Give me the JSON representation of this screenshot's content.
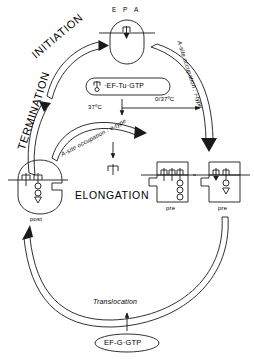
{
  "diagram": {
    "stroke_color": "#1a1a1a",
    "background_color": "#ffffff"
  },
  "labels": {
    "site_e": "E",
    "site_p": "P",
    "site_a": "A",
    "initiation": "INITIATION",
    "termination": "TERMINATION",
    "elongation": "ELONGATION",
    "translocation": "Translocation",
    "ef_tu_complex": "·EF-Tu·GTP",
    "ef_g_complex": "EF-G·GTP",
    "temp_left": "37ºC",
    "temp_right": "0/37ºC",
    "a_site_i_type": "A-site occupation : i-type",
    "a_site_e_type": "A-site occupation : e-type",
    "state_post": "post",
    "state_pre_1": "pre",
    "state_pre_2": "pre"
  },
  "icons": {
    "trna": "trna-glyph",
    "ribosome_top": "ribosome-rounded",
    "ribosome_post": "ribosome-post-notched",
    "ribosome_pre": "ribosome-pre-rect",
    "arrow": "arrowhead"
  }
}
